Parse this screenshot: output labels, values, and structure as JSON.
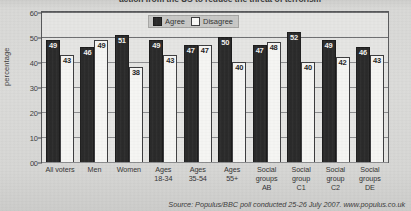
{
  "title_fragment": "action from the US to reduce the threat of terrorism",
  "legend": {
    "agree_label": "Agree",
    "disagree_label": "Disagree"
  },
  "axis": {
    "ylabel": "percentage",
    "yticks": [
      "60",
      "50",
      "40",
      "30",
      "20",
      "10",
      "0"
    ]
  },
  "source": "Source: Populus/BBC poll conducted 25-26 July 2007. www.populus.co.uk",
  "colors": {
    "agree": "#2b2b2b",
    "disagree": "#f6f6f4",
    "plot_background": "#e6e6e4",
    "page_background": "#d8d8d6"
  },
  "chart_data": {
    "type": "bar",
    "title": "action from the US to reduce the threat of terrorism",
    "xlabel": "",
    "ylabel": "percentage",
    "ylim": [
      0,
      60
    ],
    "ytick_step": 10,
    "grid": true,
    "legend_position": "top-center",
    "categories": [
      "All voters",
      "Men",
      "Women",
      "Ages 18-34",
      "Ages 35-54",
      "Ages 55+",
      "Social groups AB",
      "Social group C1",
      "Social group C2",
      "Social groups DE"
    ],
    "category_lines": [
      [
        "All voters"
      ],
      [
        "Men"
      ],
      [
        "Women"
      ],
      [
        "Ages",
        "18-34"
      ],
      [
        "Ages",
        "35-54"
      ],
      [
        "Ages",
        "55+"
      ],
      [
        "Social",
        "groups",
        "AB"
      ],
      [
        "Social",
        "group",
        "C1"
      ],
      [
        "Social",
        "group",
        "C2"
      ],
      [
        "Social",
        "groups",
        "DE"
      ]
    ],
    "series": [
      {
        "name": "Agree",
        "color": "#2b2b2b",
        "values": [
          49,
          46,
          51,
          49,
          47,
          50,
          47,
          52,
          49,
          46
        ]
      },
      {
        "name": "Disagree",
        "color": "#f6f6f4",
        "values": [
          43,
          49,
          38,
          43,
          47,
          40,
          48,
          40,
          42,
          43
        ]
      }
    ]
  }
}
